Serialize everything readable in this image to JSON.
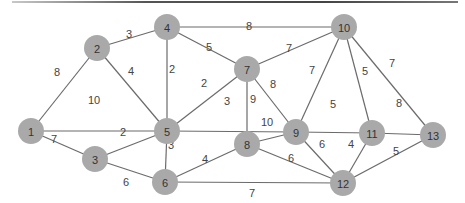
{
  "diagram": {
    "type": "weighted-undirected-graph",
    "colors": {
      "node_fill": "#a9a9a9",
      "edge": "#6b6b6b",
      "label": "#333333",
      "weight": "#444444",
      "top_border": "#555555"
    },
    "nodes": [
      {
        "id": "1",
        "x": 31,
        "y": 131
      },
      {
        "id": "2",
        "x": 97,
        "y": 48
      },
      {
        "id": "3",
        "x": 95,
        "y": 159
      },
      {
        "id": "4",
        "x": 167,
        "y": 27
      },
      {
        "id": "5",
        "x": 167,
        "y": 131
      },
      {
        "id": "6",
        "x": 165,
        "y": 182
      },
      {
        "id": "7",
        "x": 247,
        "y": 69
      },
      {
        "id": "8",
        "x": 247,
        "y": 144
      },
      {
        "id": "9",
        "x": 296,
        "y": 132
      },
      {
        "id": "10",
        "x": 344,
        "y": 27
      },
      {
        "id": "11",
        "x": 372,
        "y": 133
      },
      {
        "id": "12",
        "x": 343,
        "y": 183
      },
      {
        "id": "13",
        "x": 433,
        "y": 135
      }
    ],
    "edges": [
      {
        "from": "1",
        "to": "2",
        "weight": "8",
        "lx": 57,
        "ly": 72
      },
      {
        "from": "1",
        "to": "5",
        "weight": "10",
        "lx": 94,
        "ly": 100
      },
      {
        "from": "1",
        "to": "3",
        "weight": "7",
        "lx": 54,
        "ly": 139
      },
      {
        "from": "2",
        "to": "4",
        "weight": "3",
        "lx": 129,
        "ly": 34
      },
      {
        "from": "2",
        "to": "5",
        "weight": "4",
        "lx": 131,
        "ly": 71
      },
      {
        "from": "3",
        "to": "5",
        "weight": "2",
        "lx": 123,
        "ly": 132
      },
      {
        "from": "3",
        "to": "6",
        "weight": "6",
        "lx": 126,
        "ly": 182
      },
      {
        "from": "4",
        "to": "10",
        "weight": "8",
        "lx": 249,
        "ly": 26
      },
      {
        "from": "4",
        "to": "7",
        "weight": "5",
        "lx": 209,
        "ly": 47
      },
      {
        "from": "4",
        "to": "5",
        "weight": "2",
        "lx": 172,
        "ly": 69
      },
      {
        "from": "5",
        "to": "7",
        "weight": "2",
        "lx": 204,
        "ly": 83
      },
      {
        "from": "5",
        "to": "9",
        "weight": "3",
        "lx": 227,
        "ly": 101
      },
      {
        "from": "5",
        "to": "6",
        "weight": "3",
        "lx": 171,
        "ly": 145
      },
      {
        "from": "6",
        "to": "8",
        "weight": "4",
        "lx": 205,
        "ly": 159
      },
      {
        "from": "6",
        "to": "12",
        "weight": "7",
        "lx": 252,
        "ly": 193
      },
      {
        "from": "7",
        "to": "10",
        "weight": "7",
        "lx": 289,
        "ly": 48
      },
      {
        "from": "7",
        "to": "9",
        "weight": "8",
        "lx": 273,
        "ly": 84
      },
      {
        "from": "7",
        "to": "8",
        "weight": "9",
        "lx": 253,
        "ly": 99
      },
      {
        "from": "8",
        "to": "9",
        "weight": "10",
        "lx": 267,
        "ly": 122
      },
      {
        "from": "8",
        "to": "12",
        "weight": "6",
        "lx": 291,
        "ly": 158
      },
      {
        "from": "9",
        "to": "10",
        "weight": "7",
        "lx": 312,
        "ly": 70
      },
      {
        "from": "9",
        "to": "11",
        "weight": "5",
        "lx": 333,
        "ly": 104
      },
      {
        "from": "9",
        "to": "12",
        "weight": "6",
        "lx": 322,
        "ly": 144
      },
      {
        "from": "10",
        "to": "11",
        "weight": "5",
        "lx": 365,
        "ly": 71
      },
      {
        "from": "10",
        "to": "13",
        "weight": "7",
        "lx": 392,
        "ly": 63
      },
      {
        "from": "11",
        "to": "13",
        "weight": "8",
        "lx": 399,
        "ly": 103
      },
      {
        "from": "11",
        "to": "12",
        "weight": "4",
        "lx": 351,
        "ly": 144
      },
      {
        "from": "12",
        "to": "13",
        "weight": "5",
        "lx": 396,
        "ly": 151
      }
    ]
  }
}
